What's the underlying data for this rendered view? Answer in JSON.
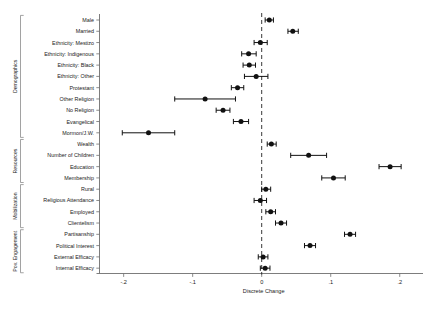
{
  "chart_data": {
    "type": "scatter",
    "title": "",
    "subtitle": "",
    "xlabel": "Discrete Change",
    "ylabel": "",
    "xlim": [
      -0.235,
      0.225
    ],
    "xticks": [
      -0.2,
      -0.1,
      0,
      0.1,
      0.2
    ],
    "xtick_labels": [
      "-.2",
      "-.1",
      "0",
      ".1",
      ".2"
    ],
    "grid": false,
    "legend": null,
    "zero_reference_line": 0,
    "orientation": "horizontal",
    "categories": [
      "Male",
      "Married",
      "Ethnicity: Mestizo",
      "Ethnicity: Indigenous",
      "Ethnicity: Black",
      "Ethnicity: Other",
      "Protestant",
      "Other Religion",
      "No Religion",
      "Evangelical",
      "Mormon/J.W.",
      "Wealth",
      "Number of Children",
      "Education",
      "Membership",
      "Rural",
      "Religious Attendance",
      "Employed",
      "Clientelism",
      "Partisanship",
      "Political Interest",
      "External Efficacy",
      "Internal Efficacy"
    ],
    "values": [
      0.011,
      0.045,
      -0.002,
      -0.019,
      -0.018,
      -0.008,
      -0.035,
      -0.082,
      -0.056,
      -0.03,
      -0.164,
      0.014,
      0.068,
      0.186,
      0.104,
      0.006,
      -0.002,
      0.013,
      0.028,
      0.128,
      0.07,
      0.002,
      0.005
    ],
    "ci_low": [
      0.005,
      0.038,
      -0.011,
      -0.029,
      -0.027,
      -0.025,
      -0.044,
      -0.126,
      -0.066,
      -0.041,
      -0.202,
      0.008,
      0.042,
      0.17,
      0.087,
      0.0,
      -0.011,
      0.006,
      0.02,
      0.12,
      0.062,
      -0.005,
      -0.002
    ],
    "ci_high": [
      0.017,
      0.053,
      0.008,
      -0.008,
      -0.009,
      0.009,
      -0.026,
      -0.038,
      -0.046,
      -0.019,
      -0.126,
      0.021,
      0.094,
      0.202,
      0.121,
      0.013,
      0.007,
      0.02,
      0.036,
      0.136,
      0.078,
      0.009,
      0.012
    ],
    "groups": [
      {
        "label": "Demographics",
        "from": "Male",
        "to": "Mormon/J.W.",
        "start_index": 0,
        "end_index": 10
      },
      {
        "label": "Resources",
        "from": "Wealth",
        "to": "Membership",
        "start_index": 11,
        "end_index": 14
      },
      {
        "label": "Mobilization",
        "from": "Rural",
        "to": "Clientelism",
        "start_index": 15,
        "end_index": 18
      },
      {
        "label": "Pov. Engagement",
        "from": "Partisanship",
        "to": "Internal Efficacy",
        "start_index": 19,
        "end_index": 22
      }
    ],
    "marker": "filled-circle",
    "error_bar_style": "capped-horizontal",
    "colors": {
      "point": "#111111",
      "error_bar": "#111111",
      "zero_line": "#222222",
      "axis": "#6e6e6e",
      "background": "#ffffff",
      "text": "#1a1a1a"
    }
  }
}
